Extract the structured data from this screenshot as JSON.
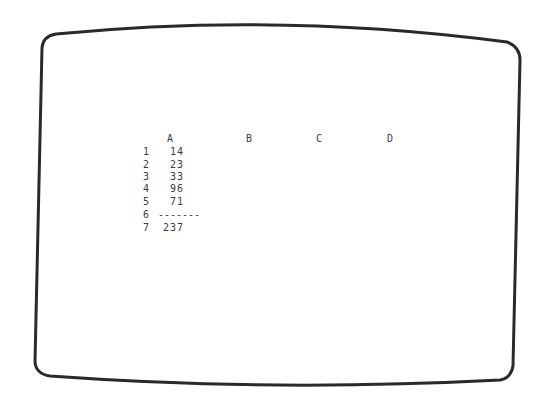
{
  "screen": {
    "type": "spreadsheet-display",
    "border_color": "#2a2a2a",
    "background": "#ffffff",
    "text_color": "#3c3c3c"
  },
  "spreadsheet": {
    "column_headers": [
      "A",
      "B",
      "C",
      "D"
    ],
    "rows": [
      {
        "row": "1",
        "A": "14"
      },
      {
        "row": "2",
        "A": "23"
      },
      {
        "row": "3",
        "A": "33"
      },
      {
        "row": "4",
        "A": "96"
      },
      {
        "row": "5",
        "A": "71"
      },
      {
        "row": "6",
        "A": "-------"
      },
      {
        "row": "7",
        "A": "237"
      }
    ]
  }
}
